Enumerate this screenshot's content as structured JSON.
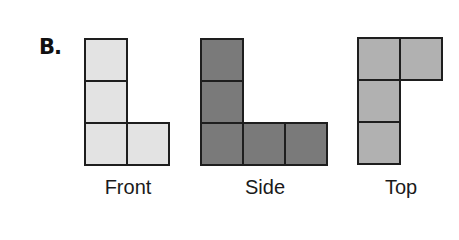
{
  "problem_label": "B.",
  "cell_size": 44,
  "views": [
    {
      "name": "Front",
      "fill": "#e3e3e3",
      "origin": [
        84,
        38
      ],
      "cells": [
        [
          0,
          0
        ],
        [
          0,
          1
        ],
        [
          0,
          2
        ],
        [
          1,
          2
        ]
      ]
    },
    {
      "name": "Side",
      "fill": "#7a7a7a",
      "origin": [
        200,
        38
      ],
      "cells": [
        [
          0,
          0
        ],
        [
          0,
          1
        ],
        [
          0,
          2
        ],
        [
          1,
          2
        ],
        [
          2,
          2
        ]
      ]
    },
    {
      "name": "Top",
      "fill": "#b1b1b1",
      "origin": [
        357,
        37
      ],
      "cells": [
        [
          0,
          0
        ],
        [
          1,
          0
        ],
        [
          0,
          1
        ],
        [
          0,
          2
        ]
      ]
    }
  ],
  "captions": {
    "front": "Front",
    "side": "Side",
    "top": "Top"
  }
}
